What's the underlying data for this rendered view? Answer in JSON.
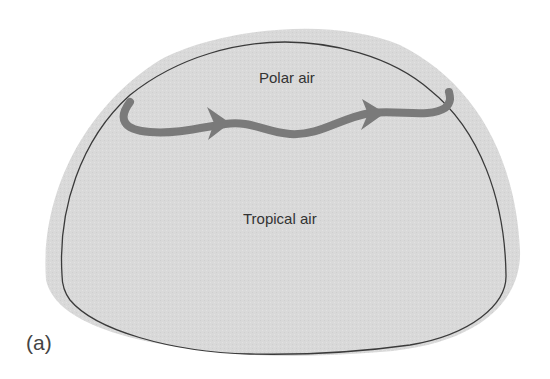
{
  "diagram": {
    "regions": {
      "polar": {
        "label": "Polar air"
      },
      "tropical": {
        "label": "Tropical air"
      }
    },
    "panel_label": "(a)",
    "colors": {
      "background": "#ffffff",
      "hemisphere_fill": "#d8d8d8",
      "outline": "#3a3a3a",
      "jet_stream": "#7a7a7a",
      "text": "#333333"
    }
  }
}
